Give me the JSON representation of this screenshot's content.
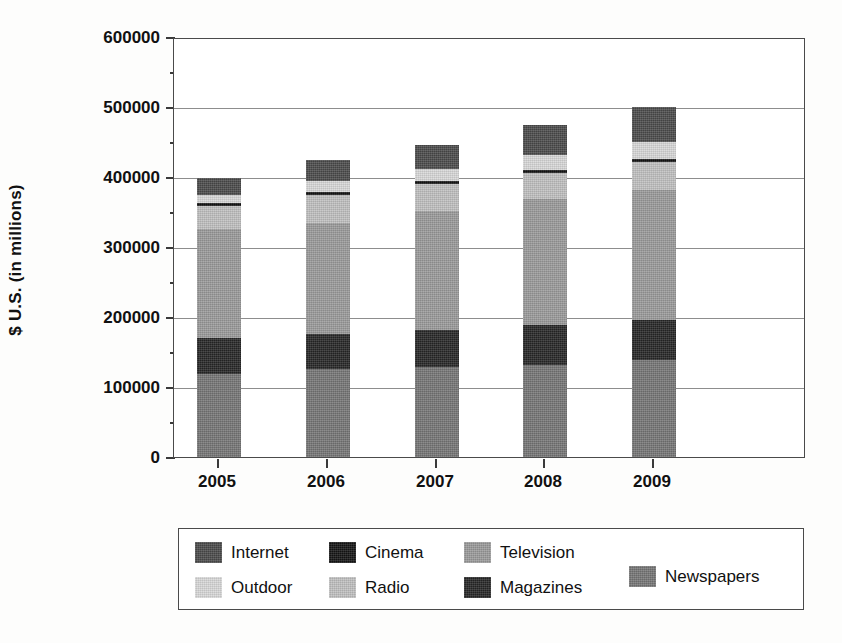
{
  "chart_data": {
    "type": "bar",
    "subtype": "stacked-bar",
    "title": "",
    "xlabel": "",
    "ylabel": "$ U.S. (in millions)",
    "categories": [
      "2005",
      "2006",
      "2007",
      "2008",
      "2009"
    ],
    "ylim": [
      0,
      600000
    ],
    "yticks": [
      0,
      100000,
      200000,
      300000,
      400000,
      500000,
      600000
    ],
    "ytick_labels": [
      "0",
      "100000",
      "200000",
      "300000",
      "400000",
      "500000",
      "600000"
    ],
    "grid": true,
    "legend_position": "below-center",
    "stack_order_bottom_to_top": [
      "Newspapers",
      "Magazines",
      "Television",
      "Radio",
      "Cinema",
      "Outdoor",
      "Internet"
    ],
    "series": [
      {
        "name": "Newspapers",
        "color": "#757575",
        "values": [
          118000,
          126000,
          128000,
          132000,
          138000
        ]
      },
      {
        "name": "Magazines",
        "color": "#262626",
        "values": [
          52000,
          50000,
          54000,
          56000,
          58000
        ]
      },
      {
        "name": "Television",
        "color": "#9a9a9a",
        "values": [
          156000,
          158000,
          170000,
          180000,
          186000
        ]
      },
      {
        "name": "Radio",
        "color": "#c0c0c0",
        "values": [
          33000,
          40000,
          38000,
          38000,
          40000
        ]
      },
      {
        "name": "Cinema",
        "color": "#141414",
        "values": [
          4000,
          4000,
          4000,
          4000,
          4000
        ]
      },
      {
        "name": "Outdoor",
        "color": "#d8d8d8",
        "values": [
          12000,
          16000,
          18000,
          22000,
          24000
        ]
      },
      {
        "name": "Internet",
        "color": "#4a4a4a",
        "values": [
          24000,
          30000,
          34000,
          42000,
          50000
        ]
      }
    ],
    "totals": [
      399000,
      424000,
      446000,
      474000,
      496000
    ]
  },
  "axis": {
    "y_title": "$ U.S. (in millions)",
    "y_tick_labels": [
      "600000",
      "500000",
      "400000",
      "300000",
      "200000",
      "100000",
      "0"
    ],
    "x_tick_labels": [
      "2005",
      "2006",
      "2007",
      "2008",
      "2009"
    ]
  },
  "legend": {
    "items": [
      {
        "label": "Internet",
        "color": "#4a4a4a"
      },
      {
        "label": "Cinema",
        "color": "#141414"
      },
      {
        "label": "Television",
        "color": "#9a9a9a"
      },
      {
        "label": "Newspapers",
        "color": "#757575"
      },
      {
        "label": "Outdoor",
        "color": "#d8d8d8"
      },
      {
        "label": "Radio",
        "color": "#c0c0c0"
      },
      {
        "label": "Magazines",
        "color": "#262626"
      }
    ]
  }
}
